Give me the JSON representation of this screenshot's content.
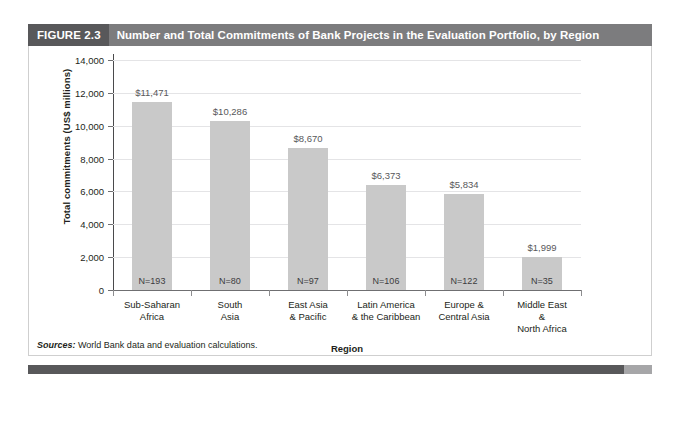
{
  "figure": {
    "tag": "FIGURE 2.3",
    "title": "Number and Total Commitments of Bank Projects in the Evaluation Portfolio, by Region",
    "sources_label": "Sources:",
    "sources_text": " World Bank data and evaluation calculations.",
    "colors": {
      "tag_band": "#58585a",
      "title_band": "#7c7c7e",
      "bar_fill": "#c9c9c9",
      "gridline": "#e4e4e6",
      "axis": "#6f6f71",
      "text": "#231f20",
      "value_label": "#58585a",
      "footer_dark": "#58585a",
      "footer_light": "#a6a6a8"
    }
  },
  "chart_data": {
    "type": "bar",
    "title": "Number and Total Commitments of Bank Projects in the Evaluation Portfolio, by Region",
    "xlabel": "Region",
    "ylabel": "Total commitments (US$ millions)",
    "ylim": [
      0,
      14000
    ],
    "ytick_step": 2000,
    "ytick_labels": [
      "14,000",
      "12,000",
      "10,000",
      "8,000",
      "6,000",
      "4,000",
      "2,000",
      "0"
    ],
    "ytick_values": [
      14000,
      12000,
      10000,
      8000,
      6000,
      4000,
      2000,
      0
    ],
    "grid": true,
    "legend": null,
    "categories": [
      "Sub-Saharan\nAfrica",
      "South\nAsia",
      "East Asia\n& Pacific",
      "Latin America\n& the Caribbean",
      "Europe &\nCentral Asia",
      "Middle East\n&\nNorth Africa"
    ],
    "values": [
      11471,
      10286,
      8670,
      6373,
      5834,
      1999
    ],
    "value_labels": [
      "$11,471",
      "$10,286",
      "$8,670",
      "$6,373",
      "$5,834",
      "$1,999"
    ],
    "counts": [
      193,
      80,
      97,
      106,
      122,
      35
    ],
    "count_labels": [
      "N=193",
      "N=80",
      "N=97",
      "N=106",
      "N=122",
      "N=35"
    ],
    "bars": [
      {
        "category": "Sub-Saharan Africa",
        "lines": [
          "Sub-Saharan",
          "Africa"
        ],
        "value": 11471,
        "value_label": "$11,471",
        "count_label": "N=193"
      },
      {
        "category": "South Asia",
        "lines": [
          "South",
          "Asia"
        ],
        "value": 10286,
        "value_label": "$10,286",
        "count_label": "N=80"
      },
      {
        "category": "East Asia & Pacific",
        "lines": [
          "East Asia",
          "& Pacific"
        ],
        "value": 8670,
        "value_label": "$8,670",
        "count_label": "N=97"
      },
      {
        "category": "Latin America & the Caribbean",
        "lines": [
          "Latin America",
          "& the Caribbean"
        ],
        "value": 6373,
        "value_label": "$6,373",
        "count_label": "N=106"
      },
      {
        "category": "Europe & Central Asia",
        "lines": [
          "Europe &",
          "Central Asia"
        ],
        "value": 5834,
        "value_label": "$5,834",
        "count_label": "N=122"
      },
      {
        "category": "Middle East & North Africa",
        "lines": [
          "Middle East",
          "&",
          "North Africa"
        ],
        "value": 1999,
        "value_label": "$1,999",
        "count_label": "N=35"
      }
    ]
  }
}
